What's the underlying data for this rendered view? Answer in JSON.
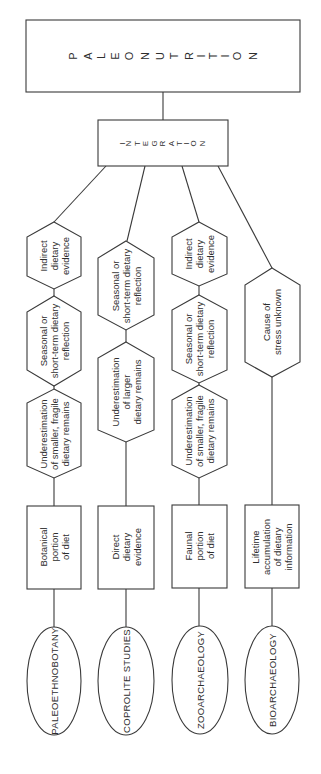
{
  "title": {
    "letters": [
      "P",
      "A",
      "L",
      "E",
      "O",
      "N",
      "U",
      "T",
      "R",
      "I",
      "T",
      "I",
      "O",
      "N"
    ],
    "text": "PALEONUTRITION"
  },
  "integration": {
    "letters": [
      "I",
      "N",
      "T",
      "E",
      "G",
      "R",
      "A",
      "T",
      "I",
      "O",
      "N"
    ],
    "text": "INTEGRATION"
  },
  "columns": [
    {
      "discipline": "PALEOETHNOBOTANY",
      "portion": "Botanical\nportion\nof diet",
      "hexagons": [
        "Indirect\ndietary\nevidence",
        "Seasonal or\nshort-term dietary\nreflection",
        "Underestimation\nof smaller, fragile\ndietary remains"
      ]
    },
    {
      "discipline": "COPROLITE  STUDIES",
      "portion": "Direct\ndietary\nevidence",
      "hexagons": [
        "Seasonal or\nshort-term dietary\nreflection",
        "Underestimation\nof larger\ndietary remains"
      ]
    },
    {
      "discipline": "ZOOARCHAEOLOGY",
      "portion": "Faunal\nportion\nof diet",
      "hexagons": [
        "Indirect\ndietary\nevidence",
        "Seasonal or\nshort-term dietary\nreflection",
        "Underestimation\nof smaller, fragile\ndietary remains"
      ]
    },
    {
      "discipline": "BIOARCHAEOLOGY",
      "portion": "Lifetime\naccumulation\nof dietary\ninformation",
      "hexagons": [
        "Cause of\nstress unknown"
      ]
    }
  ],
  "colors": {
    "line": "#3a3a3a",
    "text": "#2e2e2e",
    "background": "#ffffff"
  }
}
